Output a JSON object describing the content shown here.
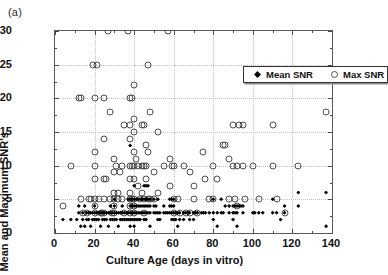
{
  "panel_label": "(a)",
  "legend": {
    "entries": [
      {
        "label": "Mean SNR",
        "marker": "filled-diamond"
      },
      {
        "label": "Max SNR",
        "marker": "open-circle"
      }
    ]
  },
  "chart_data": {
    "type": "scatter",
    "title": "",
    "xlabel": "Culture Age (days in vitro)",
    "ylabel": "Mean and Maximum SNR's",
    "xlim": [
      0,
      140
    ],
    "ylim": [
      0,
      30
    ],
    "xticks": [
      0,
      20,
      40,
      60,
      80,
      100,
      120,
      140
    ],
    "yticks": [
      0,
      5,
      10,
      15,
      20,
      25,
      30
    ],
    "xtick_labels": [
      "0",
      "20",
      "40",
      "60",
      "80",
      "100",
      "120",
      "140"
    ],
    "ytick_labels": [
      "0",
      "5",
      "10",
      "15",
      "20",
      "25",
      "30"
    ],
    "grid": true,
    "legend_position": "top-right",
    "series": [
      {
        "name": "Max SNR",
        "marker": "open-circle",
        "color": "#4d4d4d",
        "points": [
          [
            4,
            4
          ],
          [
            8,
            10
          ],
          [
            12,
            20
          ],
          [
            13,
            20
          ],
          [
            13,
            5
          ],
          [
            14,
            3
          ],
          [
            16,
            3
          ],
          [
            17,
            5
          ],
          [
            18,
            5
          ],
          [
            19,
            25
          ],
          [
            20,
            20
          ],
          [
            20,
            12
          ],
          [
            20,
            10
          ],
          [
            20,
            8
          ],
          [
            20,
            5
          ],
          [
            20,
            4
          ],
          [
            20,
            3
          ],
          [
            21,
            25
          ],
          [
            22,
            5
          ],
          [
            23,
            3
          ],
          [
            24,
            3
          ],
          [
            25,
            20
          ],
          [
            25,
            14
          ],
          [
            25,
            8
          ],
          [
            25,
            5
          ],
          [
            25,
            3
          ],
          [
            26,
            8
          ],
          [
            27,
            30
          ],
          [
            28,
            18
          ],
          [
            28,
            5
          ],
          [
            29,
            3
          ],
          [
            30,
            11
          ],
          [
            30,
            9
          ],
          [
            30,
            6
          ],
          [
            30,
            5
          ],
          [
            30,
            4
          ],
          [
            30,
            3
          ],
          [
            31,
            10
          ],
          [
            32,
            6
          ],
          [
            32,
            5
          ],
          [
            33,
            9
          ],
          [
            34,
            10
          ],
          [
            34,
            5
          ],
          [
            35,
            16
          ],
          [
            35,
            3
          ],
          [
            37,
            30
          ],
          [
            38,
            20
          ],
          [
            38,
            16
          ],
          [
            38,
            14
          ],
          [
            38,
            10
          ],
          [
            38,
            8
          ],
          [
            38,
            6
          ],
          [
            38,
            5
          ],
          [
            38,
            4
          ],
          [
            38,
            3
          ],
          [
            39,
            20
          ],
          [
            39,
            10
          ],
          [
            39,
            5
          ],
          [
            40,
            22
          ],
          [
            40,
            17
          ],
          [
            40,
            15
          ],
          [
            40,
            12
          ],
          [
            40,
            10
          ],
          [
            40,
            8
          ],
          [
            40,
            5
          ],
          [
            40,
            4
          ],
          [
            40,
            3
          ],
          [
            41,
            11
          ],
          [
            42,
            10
          ],
          [
            42,
            7
          ],
          [
            43,
            5
          ],
          [
            44,
            16
          ],
          [
            44,
            10
          ],
          [
            44,
            6
          ],
          [
            45,
            16
          ],
          [
            45,
            10
          ],
          [
            45,
            5
          ],
          [
            45,
            3
          ],
          [
            46,
            13
          ],
          [
            46,
            10
          ],
          [
            46,
            8
          ],
          [
            47,
            12
          ],
          [
            47,
            25
          ],
          [
            47,
            5
          ],
          [
            48,
            18
          ],
          [
            48,
            5
          ],
          [
            50,
            9
          ],
          [
            50,
            5
          ],
          [
            52,
            15
          ],
          [
            52,
            6
          ],
          [
            55,
            10
          ],
          [
            57,
            30
          ],
          [
            58,
            11
          ],
          [
            58,
            7
          ],
          [
            59,
            10
          ],
          [
            60,
            10
          ],
          [
            60,
            5
          ],
          [
            60,
            3
          ],
          [
            62,
            5
          ],
          [
            63,
            3
          ],
          [
            65,
            10
          ],
          [
            66,
            3
          ],
          [
            68,
            9
          ],
          [
            68,
            3
          ],
          [
            70,
            7
          ],
          [
            70,
            5
          ],
          [
            72,
            3
          ],
          [
            75,
            12
          ],
          [
            76,
            8
          ],
          [
            78,
            5
          ],
          [
            80,
            10
          ],
          [
            80,
            5
          ],
          [
            82,
            8
          ],
          [
            85,
            13
          ],
          [
            86,
            13
          ],
          [
            88,
            11
          ],
          [
            88,
            5
          ],
          [
            90,
            16
          ],
          [
            90,
            10
          ],
          [
            91,
            5
          ],
          [
            92,
            10
          ],
          [
            92,
            4
          ],
          [
            93,
            16
          ],
          [
            95,
            16
          ],
          [
            95,
            10
          ],
          [
            96,
            5
          ],
          [
            100,
            10
          ],
          [
            103,
            5
          ],
          [
            110,
            16
          ],
          [
            110,
            10
          ],
          [
            112,
            5
          ],
          [
            116,
            3
          ],
          [
            123,
            10
          ],
          [
            137,
            18
          ]
        ]
      },
      {
        "name": "Mean SNR",
        "marker": "filled-diamond",
        "color": "#000000",
        "points": [
          [
            4,
            2
          ],
          [
            8,
            2
          ],
          [
            11,
            2
          ],
          [
            12,
            4
          ],
          [
            12,
            3
          ],
          [
            13,
            1
          ],
          [
            14,
            3
          ],
          [
            14,
            2
          ],
          [
            15,
            4
          ],
          [
            15,
            1
          ],
          [
            16,
            3
          ],
          [
            16,
            2
          ],
          [
            17,
            3
          ],
          [
            17,
            2
          ],
          [
            18,
            3
          ],
          [
            18,
            1
          ],
          [
            19,
            3
          ],
          [
            19,
            2
          ],
          [
            20,
            4
          ],
          [
            20,
            3
          ],
          [
            20,
            2
          ],
          [
            21,
            3
          ],
          [
            21,
            2
          ],
          [
            22,
            3
          ],
          [
            22,
            2
          ],
          [
            23,
            3
          ],
          [
            23,
            1
          ],
          [
            24,
            3
          ],
          [
            24,
            2
          ],
          [
            25,
            3
          ],
          [
            25,
            2
          ],
          [
            26,
            3
          ],
          [
            26,
            2
          ],
          [
            27,
            3
          ],
          [
            27,
            1
          ],
          [
            28,
            4
          ],
          [
            28,
            3
          ],
          [
            28,
            2
          ],
          [
            29,
            3
          ],
          [
            29,
            2
          ],
          [
            30,
            5
          ],
          [
            30,
            4
          ],
          [
            30,
            3
          ],
          [
            30,
            2
          ],
          [
            31,
            3
          ],
          [
            31,
            2
          ],
          [
            32,
            3
          ],
          [
            32,
            1
          ],
          [
            33,
            3
          ],
          [
            33,
            2
          ],
          [
            34,
            4
          ],
          [
            34,
            3
          ],
          [
            34,
            2
          ],
          [
            35,
            3
          ],
          [
            35,
            2
          ],
          [
            36,
            3
          ],
          [
            36,
            2
          ],
          [
            37,
            5
          ],
          [
            37,
            3
          ],
          [
            37,
            2
          ],
          [
            38,
            13
          ],
          [
            38,
            5
          ],
          [
            38,
            4
          ],
          [
            38,
            3
          ],
          [
            38,
            2
          ],
          [
            38,
            1
          ],
          [
            39,
            5
          ],
          [
            39,
            4
          ],
          [
            39,
            3
          ],
          [
            39,
            2
          ],
          [
            40,
            7
          ],
          [
            40,
            5
          ],
          [
            40,
            4
          ],
          [
            40,
            3
          ],
          [
            40,
            2
          ],
          [
            40,
            1
          ],
          [
            41,
            5
          ],
          [
            41,
            4
          ],
          [
            41,
            3
          ],
          [
            41,
            2
          ],
          [
            42,
            5
          ],
          [
            42,
            4
          ],
          [
            42,
            3
          ],
          [
            42,
            2
          ],
          [
            43,
            5
          ],
          [
            43,
            4
          ],
          [
            43,
            3
          ],
          [
            43,
            2
          ],
          [
            44,
            5
          ],
          [
            44,
            4
          ],
          [
            44,
            3
          ],
          [
            45,
            7
          ],
          [
            45,
            5
          ],
          [
            45,
            4
          ],
          [
            45,
            3
          ],
          [
            45,
            2
          ],
          [
            46,
            7
          ],
          [
            46,
            5
          ],
          [
            46,
            4
          ],
          [
            46,
            3
          ],
          [
            46,
            2
          ],
          [
            47,
            7
          ],
          [
            47,
            5
          ],
          [
            47,
            4
          ],
          [
            47,
            3
          ],
          [
            48,
            5
          ],
          [
            48,
            4
          ],
          [
            48,
            3
          ],
          [
            48,
            1
          ],
          [
            50,
            5
          ],
          [
            50,
            4
          ],
          [
            50,
            3
          ],
          [
            51,
            4
          ],
          [
            51,
            3
          ],
          [
            52,
            5
          ],
          [
            52,
            3
          ],
          [
            52,
            2
          ],
          [
            53,
            3
          ],
          [
            53,
            2
          ],
          [
            55,
            4
          ],
          [
            55,
            3
          ],
          [
            56,
            3
          ],
          [
            57,
            3
          ],
          [
            58,
            5
          ],
          [
            58,
            4
          ],
          [
            58,
            3
          ],
          [
            59,
            5
          ],
          [
            59,
            4
          ],
          [
            59,
            3
          ],
          [
            59,
            2
          ],
          [
            60,
            5
          ],
          [
            60,
            4
          ],
          [
            60,
            3
          ],
          [
            60,
            2
          ],
          [
            61,
            3
          ],
          [
            61,
            2
          ],
          [
            62,
            3
          ],
          [
            62,
            1
          ],
          [
            63,
            3
          ],
          [
            63,
            2
          ],
          [
            65,
            3
          ],
          [
            65,
            2
          ],
          [
            66,
            3
          ],
          [
            67,
            3
          ],
          [
            68,
            3
          ],
          [
            68,
            2
          ],
          [
            70,
            3
          ],
          [
            70,
            2
          ],
          [
            71,
            3
          ],
          [
            72,
            3
          ],
          [
            74,
            3
          ],
          [
            75,
            3
          ],
          [
            76,
            3
          ],
          [
            78,
            3
          ],
          [
            80,
            5
          ],
          [
            80,
            3
          ],
          [
            80,
            2
          ],
          [
            82,
            3
          ],
          [
            82,
            1
          ],
          [
            84,
            5
          ],
          [
            84,
            3
          ],
          [
            85,
            3
          ],
          [
            86,
            4
          ],
          [
            88,
            4
          ],
          [
            88,
            3
          ],
          [
            90,
            4
          ],
          [
            90,
            3
          ],
          [
            90,
            2
          ],
          [
            91,
            4
          ],
          [
            91,
            3
          ],
          [
            92,
            4
          ],
          [
            92,
            3
          ],
          [
            92,
            1
          ],
          [
            93,
            4
          ],
          [
            94,
            4
          ],
          [
            95,
            4
          ],
          [
            95,
            3
          ],
          [
            100,
            3
          ],
          [
            101,
            3
          ],
          [
            103,
            3
          ],
          [
            105,
            3
          ],
          [
            110,
            5
          ],
          [
            110,
            3
          ],
          [
            112,
            3
          ],
          [
            114,
            2
          ],
          [
            116,
            4
          ],
          [
            116,
            3
          ],
          [
            123,
            6
          ],
          [
            123,
            4
          ],
          [
            137,
            6
          ],
          [
            137,
            1
          ]
        ]
      }
    ]
  }
}
